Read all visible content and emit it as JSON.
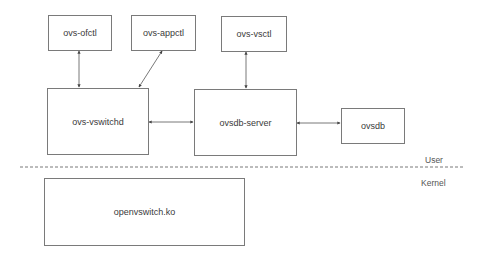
{
  "diagram": {
    "nodes": {
      "ovs_ofctl": "ovs-ofctl",
      "ovs_appctl": "ovs-appctl",
      "ovs_vsctl": "ovs-vsctl",
      "ovs_vswitchd": "ovs-vswitchd",
      "ovsdb_server": "ovsdb-server",
      "ovsdb": "ovsdb",
      "openvswitch_ko": "openvswitch.ko"
    },
    "regions": {
      "user": "User",
      "kernel": "Kernel"
    },
    "edges": [
      {
        "from": "ovs-ofctl",
        "to": "ovs-vswitchd",
        "bidirectional": true
      },
      {
        "from": "ovs-appctl",
        "to": "ovs-vswitchd",
        "bidirectional": true
      },
      {
        "from": "ovs-vsctl",
        "to": "ovsdb-server",
        "bidirectional": true
      },
      {
        "from": "ovs-vswitchd",
        "to": "ovsdb-server",
        "bidirectional": true
      },
      {
        "from": "ovsdb-server",
        "to": "ovsdb",
        "bidirectional": true
      }
    ]
  }
}
